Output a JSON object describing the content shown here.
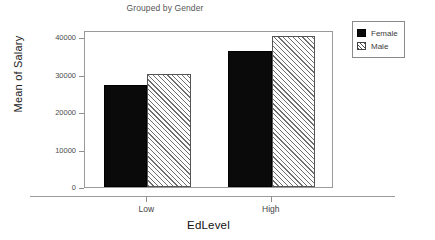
{
  "chart_data": {
    "type": "bar",
    "title": "Grouped by Gender",
    "xlabel": "EdLevel",
    "ylabel": "Mean of Salary",
    "categories": [
      "Low",
      "High"
    ],
    "series": [
      {
        "name": "Female",
        "values": [
          27300,
          36400
        ],
        "fill": "solid-black",
        "color": "#0a0a0a"
      },
      {
        "name": "Male",
        "values": [
          30100,
          40300
        ],
        "fill": "diagonal-hatch",
        "color": "#6e6e6e"
      }
    ],
    "ylim": [
      0,
      42000
    ],
    "yticks": [
      0,
      10000,
      20000,
      30000,
      40000
    ],
    "ytick_labels": [
      "0",
      "10000",
      "20000",
      "30000",
      "40000"
    ],
    "grid": false,
    "legend_position": "top-right",
    "legend_entries": [
      "Female",
      "Male"
    ]
  },
  "legend": {
    "items": [
      {
        "label": "Female"
      },
      {
        "label": "Male"
      }
    ]
  }
}
